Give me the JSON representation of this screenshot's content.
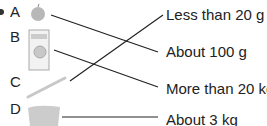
{
  "items": [
    {
      "letter": "A",
      "object": "apple"
    },
    {
      "letter": "B",
      "object": "washing machine"
    },
    {
      "letter": "C",
      "object": "pencil"
    },
    {
      "letter": "D",
      "object": "bag"
    }
  ],
  "options": [
    "Less than 20 g",
    "About 100 g",
    "More than 20 kg",
    "About 3 kg"
  ],
  "matches": [
    {
      "from": "A",
      "to": "About 100 g"
    },
    {
      "from": "B",
      "to": "More than 20 kg"
    },
    {
      "from": "C",
      "to": "Less than 20 g"
    },
    {
      "from": "D",
      "to": "About 3 kg"
    }
  ]
}
